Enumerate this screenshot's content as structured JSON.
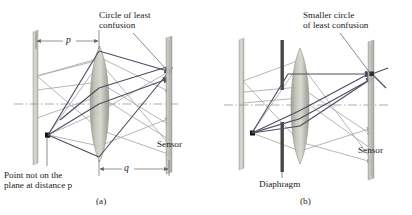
{
  "figure": {
    "panels": [
      {
        "id": "a",
        "caption": "(a)",
        "labels": {
          "circle_of_least_confusion": "Circle of least\nconfusion",
          "point_source": "Point not on the\nplane at distance p",
          "sensor": "Sensor"
        },
        "dimensions": [
          {
            "name": "p",
            "label": "p",
            "from": "object plane",
            "to": "lens"
          },
          {
            "name": "q",
            "label": "q",
            "from": "lens",
            "to": "sensor"
          }
        ],
        "elements": [
          "object-plane",
          "point-source",
          "lens",
          "sensor-plane",
          "optical-axis",
          "marginal-rays",
          "paraxial-rays"
        ]
      },
      {
        "id": "b",
        "caption": "(b)",
        "labels": {
          "circle_of_least_confusion": "Smaller circle\nof least confusion",
          "diaphragm": "Diaphragm",
          "sensor": "Sensor"
        },
        "dimensions": [],
        "elements": [
          "object-plane",
          "point-source",
          "diaphragm",
          "lens",
          "sensor-plane",
          "optical-axis",
          "blocked-rays",
          "transmitted-rays"
        ]
      }
    ],
    "colors": {
      "background": "#ffffff",
      "object_plane": "#c9c9c4",
      "sensor_plane": "#b9b9b4",
      "lens_fill": "#b6b7ac",
      "diaphragm": "#4a4a4a",
      "ray_dark": "#4b4f63",
      "ray_light": "#a9aaa6",
      "axis": "#8a8a86",
      "text": "#1a1a1a",
      "point_marker": "#111111"
    }
  }
}
